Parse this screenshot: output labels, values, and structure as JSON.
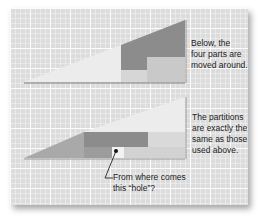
{
  "figure": {
    "top_caption": "Below, the\nfour parts are\nmoved around.",
    "bottom_caption": "The partitions\nare exactly the\nsame as those\nused above.",
    "hole_callout": "From where comes\nthis “hole”?"
  },
  "colors": {
    "background": "#dcdcdc",
    "light_piece": "#ececec",
    "medium_piece": "#a9a9a9",
    "dark_piece": "#8c8c8c",
    "pale_piece": "#d2d2d2",
    "hole": "#f2f2f2"
  }
}
